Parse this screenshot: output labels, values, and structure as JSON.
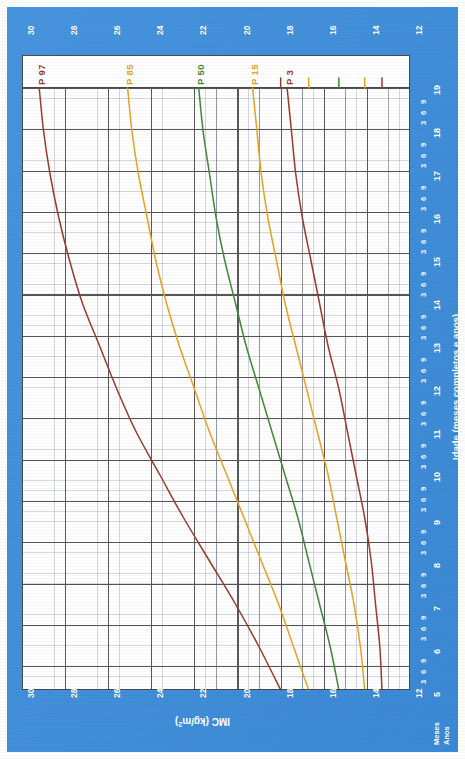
{
  "page": {
    "background_color": "#3d8edc",
    "paper_color": "#ffffff"
  },
  "axes": {
    "bmi_title": "IMC (kg/m²)",
    "bmi_title_sup": "2",
    "age_title": "Idade (meses completos e anos)",
    "months_label": "Meses",
    "years_label": "Anos",
    "bmi_ticks": [
      "30",
      "28",
      "26",
      "24",
      "22",
      "20",
      "18",
      "16",
      "14",
      "12"
    ],
    "year_ticks": [
      "19",
      "18",
      "17",
      "16",
      "15",
      "14",
      "13",
      "12",
      "11",
      "10",
      "9",
      "8",
      "7",
      "6",
      "5"
    ],
    "month_ticks": [
      "3",
      "6",
      "9"
    ]
  },
  "curves": [
    {
      "name": "P 97",
      "label": "P 97",
      "color": "#9c3a2e"
    },
    {
      "name": "P 85",
      "label": "P 85",
      "color": "#e8a321"
    },
    {
      "name": "P 50",
      "label": "P 50",
      "color": "#3f8a37"
    },
    {
      "name": "P 15",
      "label": "P 15",
      "color": "#e8a321"
    },
    {
      "name": "P 3",
      "label": "P 3",
      "color": "#9c3a2e"
    }
  ],
  "chart_data": {
    "type": "line",
    "xlabel": "IMC (kg/m²)",
    "ylabel": "Idade (meses completos e anos)",
    "xlim": [
      12,
      30
    ],
    "ylim": [
      5,
      19
    ],
    "grid": true,
    "legend": "inline-curve-labels",
    "orientation": "age on vertical axis (decreasing downward from 19 to 5), BMI on horizontal axis (decreasing left to right from 30 to 12)",
    "age_years": [
      5,
      6,
      7,
      8,
      9,
      10,
      11,
      12,
      13,
      14,
      15,
      16,
      17,
      18,
      19
    ],
    "series": [
      {
        "name": "P 97",
        "color": "#9c3a2e",
        "bmi": [
          18.0,
          19.0,
          20.1,
          21.3,
          22.5,
          23.6,
          24.7,
          25.6,
          26.4,
          27.2,
          27.8,
          28.3,
          28.7,
          29.0,
          29.2
        ]
      },
      {
        "name": "P 85",
        "color": "#e8a321",
        "bmi": [
          16.7,
          17.4,
          18.1,
          18.9,
          19.7,
          20.5,
          21.3,
          22.0,
          22.7,
          23.3,
          23.8,
          24.2,
          24.6,
          24.9,
          25.1
        ]
      },
      {
        "name": "P 50",
        "color": "#3f8a37",
        "bmi": [
          15.3,
          15.7,
          16.2,
          16.7,
          17.2,
          17.8,
          18.4,
          19.0,
          19.6,
          20.1,
          20.6,
          21.0,
          21.3,
          21.6,
          21.8
        ]
      },
      {
        "name": "P 15",
        "color": "#e8a321",
        "bmi": [
          14.1,
          14.3,
          14.6,
          15.0,
          15.4,
          15.8,
          16.3,
          16.8,
          17.3,
          17.8,
          18.2,
          18.6,
          18.9,
          19.1,
          19.3
        ]
      },
      {
        "name": "P 3",
        "color": "#9c3a2e",
        "bmi": [
          13.3,
          13.4,
          13.6,
          13.8,
          14.1,
          14.5,
          14.9,
          15.3,
          15.8,
          16.2,
          16.6,
          17.0,
          17.3,
          17.5,
          17.7
        ]
      }
    ]
  }
}
